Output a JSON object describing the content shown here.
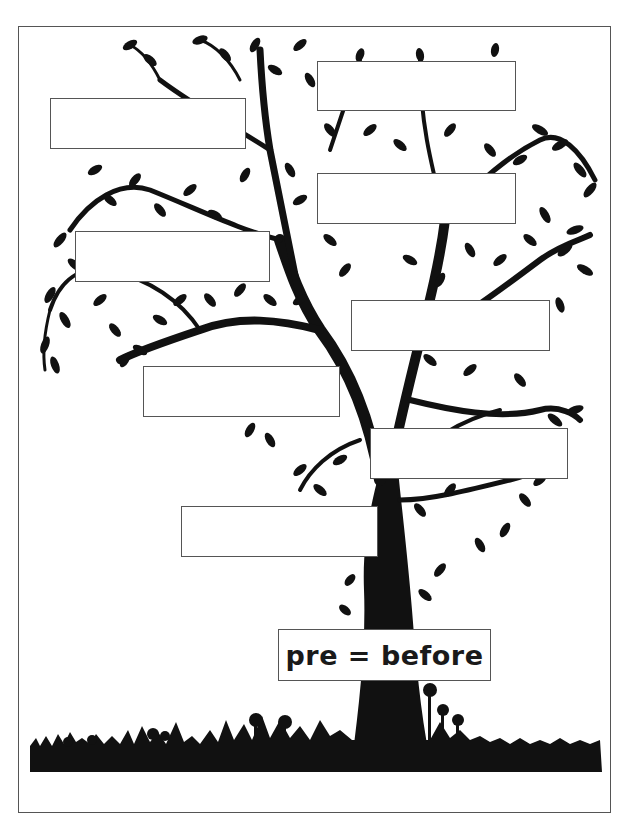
{
  "worksheet": {
    "title_label": "pre = before",
    "ink_color": "#111111",
    "border_color": "#555555",
    "blank_boxes": [
      {
        "id": "box-1",
        "value": ""
      },
      {
        "id": "box-2",
        "value": ""
      },
      {
        "id": "box-3",
        "value": ""
      },
      {
        "id": "box-4",
        "value": ""
      },
      {
        "id": "box-5",
        "value": ""
      },
      {
        "id": "box-6",
        "value": ""
      },
      {
        "id": "box-7",
        "value": ""
      },
      {
        "id": "box-8",
        "value": ""
      }
    ],
    "illustration": "tree-silhouette-with-grass-and-flowers"
  }
}
